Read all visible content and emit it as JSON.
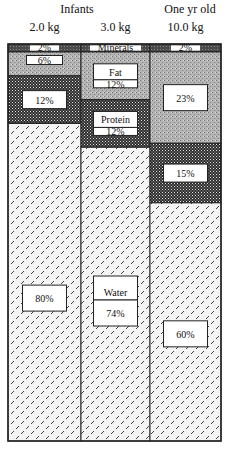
{
  "chart_data": {
    "type": "bar",
    "subtype": "stacked-100-percent",
    "title": "",
    "group_labels": [
      {
        "label": "Infants",
        "spans": [
          0,
          1
        ]
      },
      {
        "label": "One yr old",
        "spans": [
          2
        ]
      }
    ],
    "categories": [
      "2.0 kg",
      "3.0 kg",
      "10.0 kg"
    ],
    "series": [
      {
        "name": "Water",
        "values": [
          80,
          74,
          60
        ],
        "pattern": "diagonal-dashes",
        "labels": [
          "80%",
          "74%",
          "60%"
        ]
      },
      {
        "name": "Protein",
        "values": [
          12,
          12,
          15
        ],
        "pattern": "checker",
        "labels": [
          "12%",
          "12%",
          "15%"
        ]
      },
      {
        "name": "Fat",
        "values": [
          6,
          12,
          23
        ],
        "pattern": "light-stipple",
        "labels": [
          "6%",
          "12%",
          "23%"
        ]
      },
      {
        "name": "Minerals",
        "values": [
          2,
          2,
          2
        ],
        "pattern": "dark-stipple",
        "labels": [
          "2%",
          "",
          "2%"
        ]
      }
    ],
    "inline_series_names": {
      "Water": 1,
      "Protein": 1,
      "Fat": 1,
      "Minerals": 1
    },
    "xlabel": "",
    "ylabel": "",
    "ylim": [
      0,
      100
    ],
    "grid": false,
    "legend": "none (series names shown inside middle column)"
  },
  "colors": {
    "frame": "#222222",
    "minerals": "#555555",
    "fat": "#a8a8a8",
    "protein": "#3a3a3a",
    "water_bg": "#f4f4f4",
    "water_mark": "#444444",
    "label_bg": "#ffffff"
  }
}
